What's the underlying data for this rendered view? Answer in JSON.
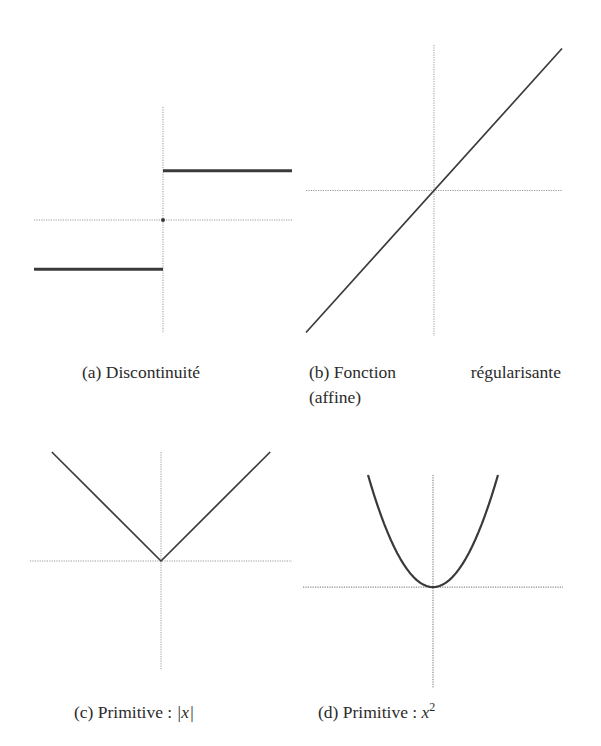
{
  "figure": {
    "subfigures": [
      {
        "id": "a",
        "label": "(a)",
        "caption": "Discontinuité"
      },
      {
        "id": "b",
        "label": "(b)",
        "caption_line1_word1": "Fonction",
        "caption_line1_word2": "régularisante",
        "caption_line2": "(affine)"
      },
      {
        "id": "c",
        "label": "(c)",
        "caption_prefix": "Primitive :",
        "caption_math": "|x|"
      },
      {
        "id": "d",
        "label": "(d)",
        "caption_prefix": "Primitive :",
        "caption_math": "x",
        "caption_sup": "2"
      }
    ],
    "colors": {
      "curve": "#3a3a3a",
      "axis": "#9a9a9a",
      "axis_dark": "#6a6a6a",
      "text": "#2b2b2b"
    }
  },
  "chart_data": [
    {
      "id": "a",
      "type": "line",
      "title": "(a) Discontinuité",
      "xlabel": "",
      "ylabel": "",
      "grid": false,
      "axes_style": "dotted, through origin",
      "xlim": [
        -1,
        1
      ],
      "ylim": [
        -2.3,
        2.3
      ],
      "series": [
        {
          "name": "left step",
          "x": [
            -1,
            0
          ],
          "y": [
            -1,
            -1
          ]
        },
        {
          "name": "right step",
          "x": [
            0,
            1
          ],
          "y": [
            1,
            1
          ]
        }
      ],
      "points": [
        {
          "name": "origin",
          "x": 0,
          "y": 0
        }
      ]
    },
    {
      "id": "b",
      "type": "line",
      "title": "(b) Fonction régularisante (affine)",
      "xlabel": "",
      "ylabel": "",
      "grid": false,
      "axes_style": "dotted, through origin",
      "xlim": [
        -1,
        1
      ],
      "ylim": [
        -2.05,
        2.05
      ],
      "function": "y = 2x",
      "series": [
        {
          "name": "affine",
          "x": [
            -1,
            1
          ],
          "y": [
            -2,
            2
          ]
        }
      ]
    },
    {
      "id": "c",
      "type": "line",
      "title": "(c) Primitive : |x|",
      "xlabel": "",
      "ylabel": "",
      "grid": false,
      "axes_style": "dotted, through origin",
      "xlim": [
        -1.2,
        1.2
      ],
      "ylim": [
        -1,
        1
      ],
      "function": "y = |x|",
      "series": [
        {
          "name": "abs",
          "x": [
            -1,
            0,
            1
          ],
          "y": [
            1,
            0,
            1
          ]
        }
      ]
    },
    {
      "id": "d",
      "type": "line",
      "title": "(d) Primitive : x^2",
      "xlabel": "",
      "ylabel": "",
      "grid": false,
      "axes_style": "dotted, through origin",
      "xlim": [
        -2,
        2
      ],
      "ylim": [
        -0.9,
        1
      ],
      "function": "y = x^2",
      "series": [
        {
          "name": "square",
          "x_range": [
            -1,
            1
          ],
          "samples": 41
        }
      ]
    }
  ]
}
